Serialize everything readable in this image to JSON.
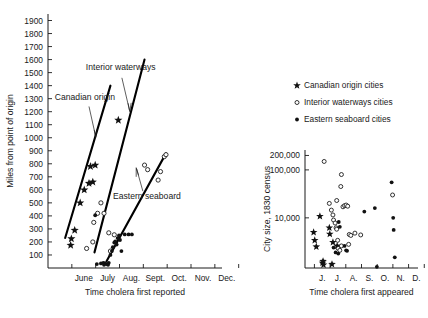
{
  "figure": {
    "background": "#ffffff",
    "ink": "#111111"
  },
  "legend": {
    "items": [
      {
        "marker": "star-marker",
        "label": "Canadian origin cities"
      },
      {
        "marker": "open-circle-marker",
        "label": "Interior waterways cities"
      },
      {
        "marker": "filled-circle-marker",
        "label": "Eastern seaboard cities"
      }
    ]
  },
  "chart_data": [
    {
      "id": "left-panel",
      "type": "scatter",
      "title": "",
      "xlabel": "Time cholera first reported",
      "ylabel": "Miles from point of origin",
      "xtick_labels": [
        "June",
        "July",
        "Aug.",
        "Sept.",
        "Oct.",
        "Nov.",
        "Dec."
      ],
      "ytick_labels": [
        "100",
        "200",
        "300",
        "400",
        "500",
        "600",
        "700",
        "800",
        "900",
        "1000",
        "1100",
        "1200",
        "1300",
        "1400",
        "1500",
        "1600",
        "1700",
        "1800",
        "1900"
      ],
      "ylim": [
        0,
        1950
      ],
      "xlim_months": [
        5.0,
        12.3
      ],
      "grid": false,
      "legend_position": "none",
      "annotations": [
        {
          "text": "Canadian origin",
          "x_month": 6.55,
          "y": 1290
        },
        {
          "text": "Interior waterways",
          "x_month": 8.05,
          "y": 1520
        },
        {
          "text": "Eastern seaboard",
          "x_month": 9.15,
          "y": 530
        }
      ],
      "trend_lines": [
        {
          "name": "Canadian origin",
          "x1_month": 5.72,
          "y1": 230,
          "x2_month": 7.62,
          "y2": 1400
        },
        {
          "name": "Interior waterways",
          "x1_month": 6.95,
          "y1": 120,
          "x2_month": 9.05,
          "y2": 1600
        },
        {
          "name": "Eastern seaboard",
          "x1_month": 7.45,
          "y1": 50,
          "x2_month": 9.95,
          "y2": 880
        }
      ],
      "series": [
        {
          "name": "Canadian origin cities",
          "marker": "star",
          "points": [
            [
              5.95,
              175
            ],
            [
              5.98,
              225
            ],
            [
              6.12,
              290
            ],
            [
              6.35,
              500
            ],
            [
              6.52,
              600
            ],
            [
              6.72,
              650
            ],
            [
              6.88,
              660
            ],
            [
              6.78,
              780
            ],
            [
              6.98,
              790
            ],
            [
              7.95,
              1135
            ]
          ]
        },
        {
          "name": "Interior waterways cities",
          "marker": "open-circle",
          "points": [
            [
              6.62,
              150
            ],
            [
              6.88,
              200
            ],
            [
              6.92,
              350
            ],
            [
              7.08,
              420
            ],
            [
              7.35,
              420
            ],
            [
              7.55,
              270
            ],
            [
              7.62,
              130
            ],
            [
              7.78,
              255
            ],
            [
              9.05,
              790
            ],
            [
              9.18,
              755
            ],
            [
              9.62,
              675
            ],
            [
              9.88,
              855
            ],
            [
              9.95,
              870
            ],
            [
              9.72,
              740
            ],
            [
              7.22,
              500
            ]
          ]
        },
        {
          "name": "Eastern seaboard cities",
          "marker": "filled-circle",
          "points": [
            [
              6.98,
              405
            ],
            [
              7.05,
              30
            ],
            [
              7.22,
              35
            ],
            [
              7.32,
              40
            ],
            [
              7.38,
              35
            ],
            [
              7.45,
              30
            ],
            [
              7.55,
              40
            ],
            [
              7.62,
              100
            ],
            [
              7.68,
              130
            ],
            [
              7.72,
              160
            ],
            [
              7.78,
              195
            ],
            [
              7.82,
              205
            ],
            [
              7.88,
              180
            ],
            [
              7.92,
              230
            ],
            [
              7.98,
              250
            ],
            [
              8.02,
              215
            ],
            [
              8.08,
              130
            ],
            [
              8.22,
              258
            ],
            [
              8.38,
              258
            ],
            [
              8.52,
              258
            ],
            [
              7.52,
              25
            ],
            [
              7.35,
              25
            ]
          ]
        }
      ]
    },
    {
      "id": "right-panel",
      "type": "scatter",
      "title": "",
      "xlabel": "Time cholera first appeared",
      "ylabel": "City size, 1830 census",
      "xtick_labels": [
        "J.",
        "J.",
        "A.",
        "S.",
        "O.",
        "N.",
        "D."
      ],
      "ytick_labels": [
        "200,000",
        "100,000",
        "10,000"
      ],
      "yscale": "log",
      "ylim": [
        900,
        260000
      ],
      "xlim_months": [
        5.4,
        12.6
      ],
      "grid": false,
      "legend_position": "above-plot",
      "series": [
        {
          "name": "Canadian origin cities",
          "marker": "star",
          "points": [
            [
              5.95,
              5000
            ],
            [
              6.02,
              3400
            ],
            [
              6.12,
              2500
            ],
            [
              6.35,
              10800
            ],
            [
              6.52,
              1150
            ],
            [
              6.55,
              1250
            ],
            [
              6.58,
              1050
            ],
            [
              6.95,
              6200
            ],
            [
              6.98,
              4600
            ],
            [
              7.12,
              1080
            ],
            [
              7.18,
              3100
            ],
            [
              7.45,
              2600
            ]
          ]
        },
        {
          "name": "Interior waterways cities",
          "marker": "open-circle",
          "points": [
            [
              6.62,
              150000
            ],
            [
              6.95,
              20000
            ],
            [
              7.08,
              14500
            ],
            [
              7.18,
              11500
            ],
            [
              7.22,
              9000
            ],
            [
              7.32,
              7800
            ],
            [
              7.38,
              6200
            ],
            [
              7.42,
              5800
            ],
            [
              7.48,
              3400
            ],
            [
              7.52,
              2300
            ],
            [
              7.62,
              2100
            ],
            [
              7.72,
              2600
            ],
            [
              7.82,
              17000
            ],
            [
              7.92,
              18000
            ],
            [
              8.02,
              18500
            ],
            [
              8.12,
              17500
            ],
            [
              7.72,
              80000
            ],
            [
              7.68,
              45000
            ],
            [
              7.42,
              23000
            ],
            [
              8.22,
              4500
            ],
            [
              8.32,
              4300
            ],
            [
              8.18,
              2800
            ],
            [
              8.58,
              4800
            ],
            [
              10.98,
              30000
            ],
            [
              8.95,
              4400
            ]
          ]
        },
        {
          "name": "Eastern seaboard cities",
          "marker": "filled-circle",
          "points": [
            [
              7.22,
              2400
            ],
            [
              7.35,
              1900
            ],
            [
              7.52,
              1800
            ],
            [
              7.92,
              2600
            ],
            [
              8.02,
              2100
            ],
            [
              8.08,
              2050
            ],
            [
              9.18,
              13500
            ],
            [
              9.85,
              16000
            ],
            [
              10.92,
              55000
            ],
            [
              11.02,
              10000
            ],
            [
              11.05,
              5600
            ],
            [
              11.12,
              1500
            ],
            [
              9.98,
              950
            ],
            [
              7.62,
              6500
            ],
            [
              7.55,
              8200
            ]
          ]
        }
      ]
    }
  ]
}
